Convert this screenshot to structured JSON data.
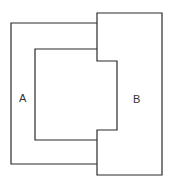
{
  "diagram": {
    "labels": {
      "a": "A",
      "b": "B"
    },
    "colors": {
      "stroke": "#2a2a2a",
      "background": "#ffffff",
      "text": "#333333"
    },
    "shapes": [
      {
        "id": "A",
        "description": "C-shaped piece opening to the right"
      },
      {
        "id": "B",
        "description": "Rectangular block with a tab protruding to the left"
      }
    ]
  }
}
